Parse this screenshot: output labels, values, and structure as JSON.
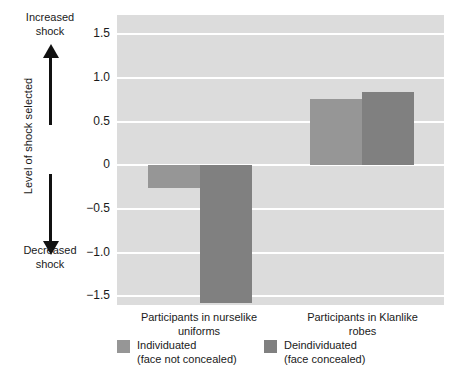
{
  "chart_data": {
    "type": "bar",
    "title": "",
    "xlabel": "",
    "ylabel": "Level of shock selected",
    "categories": [
      "Participants in nurselike uniforms",
      "Participants in Klanlike robes"
    ],
    "series": [
      {
        "name": "Individuated (face not concealed)",
        "values": [
          -0.26,
          0.76
        ],
        "color": "#969696"
      },
      {
        "name": "Deindividuated (face concealed)",
        "values": [
          -1.58,
          0.84
        ],
        "color": "#808080"
      }
    ],
    "ylim": [
      -1.6,
      1.72
    ],
    "yticks": [
      1.5,
      1.0,
      0.5,
      0,
      -0.5,
      -1.0,
      -1.5
    ],
    "ytick_labels": [
      "1.5",
      "1.0",
      "0.5",
      "0",
      "−0.5",
      "−1.0",
      "−1.5"
    ],
    "grid": true,
    "legend_position": "bottom",
    "plot_background": "#dcdcdc",
    "gridline_color": "#ffffff"
  },
  "axis": {
    "title": "Level of shock selected",
    "top_annotation_line1": "Increased",
    "top_annotation_line2": "shock",
    "bottom_annotation_line1": "Decreased",
    "bottom_annotation_line2": "shock",
    "up_arrow_icon": "arrow-up-icon",
    "down_arrow_icon": "arrow-down-icon"
  },
  "categories_display": [
    {
      "line1": "Participants in nurselike",
      "line2": "uniforms"
    },
    {
      "line1": "Participants in Klanlike",
      "line2": "robes"
    }
  ],
  "legend": [
    {
      "line1": "Individuated",
      "line2": "(face not concealed)",
      "color": "#969696"
    },
    {
      "line1": "Deindividuated",
      "line2": "(face concealed)",
      "color": "#808080"
    }
  ]
}
